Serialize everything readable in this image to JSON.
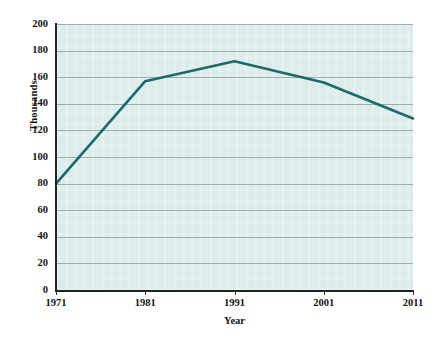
{
  "chart_data": {
    "type": "line",
    "title": "",
    "xlabel": "Year",
    "ylabel": "Thousands",
    "x": [
      1971,
      1981,
      1991,
      2001,
      2011
    ],
    "xticklabels": [
      "1971",
      "1981",
      "1991",
      "2001",
      "2011"
    ],
    "xlim": [
      1971,
      2011
    ],
    "ylim": [
      0,
      200
    ],
    "yticks": [
      0,
      20,
      40,
      60,
      80,
      100,
      120,
      140,
      160,
      180,
      200
    ],
    "yticklabels": [
      "0",
      "20",
      "40",
      "60",
      "80",
      "100",
      "120",
      "140",
      "160",
      "180",
      "200"
    ],
    "grid": "horizontal",
    "legend": "none",
    "series": [
      {
        "name": "Thousands",
        "values": [
          80,
          157,
          172,
          156,
          129
        ],
        "color": "#1d6b68",
        "line_width": 2.6
      }
    ],
    "plot_background": "#dcebec",
    "gridline_color": "#8fa4a8",
    "axis_color": "#222222",
    "figure_background": "#ffffff"
  }
}
